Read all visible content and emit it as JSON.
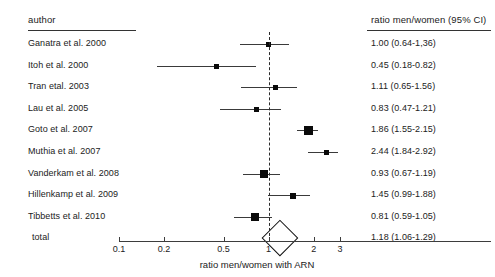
{
  "figure": {
    "type": "forest-plot",
    "width": 495,
    "height": 277
  },
  "headers": {
    "author": "author",
    "ratio": "ratio men/women (95% CI)"
  },
  "axis": {
    "title": "ratio men/women with ARN",
    "scale": "log",
    "ticks": [
      "0.1",
      "0.2",
      "0.5",
      "1",
      "2",
      "3"
    ],
    "tick_values": [
      0.1,
      0.2,
      0.5,
      1,
      2,
      3
    ],
    "null_value": 1
  },
  "rows": [
    {
      "author": "Ganatra et al. 2000",
      "value_text": "1.00 (0.64-1,36)",
      "estimate": 1.0,
      "low": 0.64,
      "high": 1.36,
      "weight": 0.9
    },
    {
      "author": "Itoh et al. 2000",
      "value_text": "0.45 (0.18-0.82)",
      "estimate": 0.45,
      "low": 0.18,
      "high": 0.82,
      "weight": 0.75
    },
    {
      "author": "Tran etal. 2003",
      "value_text": "1.11 (0.65-1.56)",
      "estimate": 1.11,
      "low": 0.65,
      "high": 1.56,
      "weight": 0.8
    },
    {
      "author": "Lau et al. 2005",
      "value_text": "0.83 (0.47-1.21)",
      "estimate": 0.83,
      "low": 0.47,
      "high": 1.21,
      "weight": 0.85
    },
    {
      "author": "Goto et al. 2007",
      "value_text": "1.86 (1.55-2.15)",
      "estimate": 1.86,
      "low": 1.55,
      "high": 2.15,
      "weight": 2.2
    },
    {
      "author": "Muthia et al. 2007",
      "value_text": "2.44 (1.84-2.92)",
      "estimate": 2.44,
      "low": 1.84,
      "high": 2.92,
      "weight": 1.0
    },
    {
      "author": "Vanderkam et al. 2008",
      "value_text": "0.93 (0.67-1.19)",
      "estimate": 0.93,
      "low": 0.67,
      "high": 1.19,
      "weight": 1.8
    },
    {
      "author": "Hillenkamp et al. 2009",
      "value_text": "1.45 (0.99-1.88)",
      "estimate": 1.45,
      "low": 0.99,
      "high": 1.88,
      "weight": 1.0
    },
    {
      "author": "Tibbetts et al. 2010",
      "value_text": "0.81 (0.59-1.05)",
      "estimate": 0.81,
      "low": 0.59,
      "high": 1.05,
      "weight": 1.9
    }
  ],
  "total": {
    "author": "total",
    "value_text": "1.18 (1.06-1.29)",
    "estimate": 1.18,
    "low": 1.06,
    "high": 1.29
  },
  "chart_data": {
    "type": "forest",
    "title": "",
    "xlabel": "ratio men/women with ARN",
    "ylabel": "",
    "xscale": "log",
    "xlim": [
      0.1,
      3
    ],
    "xticks": [
      0.1,
      0.2,
      0.5,
      1,
      2,
      3
    ],
    "reference_line": 1,
    "categories": [
      "Ganatra et al. 2000",
      "Itoh et al. 2000",
      "Tran etal. 2003",
      "Lau et al. 2005",
      "Goto et al. 2007",
      "Muthia et al. 2007",
      "Vanderkam et al. 2008",
      "Hillenkamp et al. 2009",
      "Tibbetts et al. 2010",
      "total"
    ],
    "estimates": [
      1.0,
      0.45,
      1.11,
      0.83,
      1.86,
      2.44,
      0.93,
      1.45,
      0.81,
      1.18
    ],
    "ci_low": [
      0.64,
      0.18,
      0.65,
      0.47,
      1.55,
      1.84,
      0.67,
      0.99,
      0.59,
      1.06
    ],
    "ci_high": [
      1.36,
      0.82,
      1.56,
      1.21,
      2.15,
      2.92,
      1.19,
      1.88,
      1.05,
      1.29
    ],
    "labels": [
      "1.00 (0.64-1,36)",
      "0.45 (0.18-0.82)",
      "1.11 (0.65-1.56)",
      "0.83 (0.47-1.21)",
      "1.86 (1.55-2.15)",
      "2.44 (1.84-2.92)",
      "0.93 (0.67-1.19)",
      "1.45 (0.99-1.88)",
      "0.81 (0.59-1.05)",
      "1.18 (1.06-1.29)"
    ],
    "legend": [],
    "grid": false
  },
  "layout": {
    "author_x": 28,
    "value_x": 371,
    "header_y": 14,
    "author_rule": {
      "x": 28,
      "y": 30,
      "w": 108
    },
    "value_rule": {
      "x": 367,
      "y": 30,
      "w": 124
    },
    "first_row_y": 44,
    "row_step": 21.6,
    "plot": {
      "x_min_px": 119,
      "x_max_px": 340,
      "axis_y": 241
    },
    "axis_title_x": 257,
    "axis_title_y": 259
  }
}
